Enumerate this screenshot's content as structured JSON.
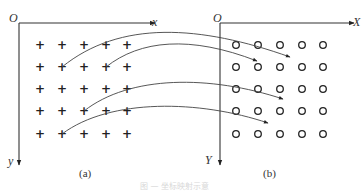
{
  "panel_a": {
    "origin_label": "O",
    "x_axis_label": "x",
    "y_axis_label": "y",
    "subcaption": "(a)",
    "marker": "+",
    "grid_rows": 5,
    "grid_cols": 5
  },
  "panel_b": {
    "origin_label": "O",
    "x_axis_label": "X",
    "y_axis_label": "Y",
    "subcaption": "(b)",
    "marker": "o",
    "grid_rows": 5,
    "grid_cols": 5
  },
  "mappings": [
    {
      "from": {
        "row": 2,
        "col": 2
      },
      "to_panel": "b",
      "description": "arrow curve to between row 1 and row 2, cols 3-4"
    },
    {
      "from": {
        "row": 2,
        "col": 4
      },
      "to_panel": "b",
      "description": "arrow curve to between row 1 and row 2, col 2"
    },
    {
      "from": {
        "row": 4,
        "col": 3
      },
      "to_panel": "b",
      "description": "arrow curve to between row 3 and row 4, col 3"
    },
    {
      "from": {
        "row": 5,
        "col": 2
      },
      "to_panel": "b",
      "description": "arrow curve to between row 4 and row 5, cols 2-3"
    }
  ],
  "caption": "图 — 坐标映射示意"
}
